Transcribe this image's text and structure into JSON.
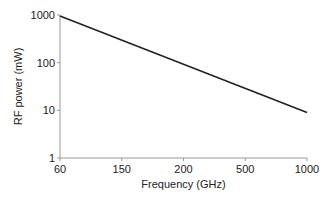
{
  "chart_data": {
    "type": "line",
    "title": "",
    "xlabel": "Frequency (GHz)",
    "ylabel": "RF power (mW)",
    "x_scale": "categorical-evenly-spaced",
    "y_scale": "log",
    "xticks": [
      "60",
      "150",
      "200",
      "500",
      "1000"
    ],
    "yticks": [
      "1",
      "10",
      "100",
      "1000"
    ],
    "ylim": [
      1,
      1000
    ],
    "grid": false,
    "legend": "none",
    "series": [
      {
        "name": "RF power",
        "color": "#222222",
        "points": [
          {
            "x": "60",
            "y": 950
          },
          {
            "x": "1000",
            "y": 9
          }
        ]
      }
    ]
  }
}
